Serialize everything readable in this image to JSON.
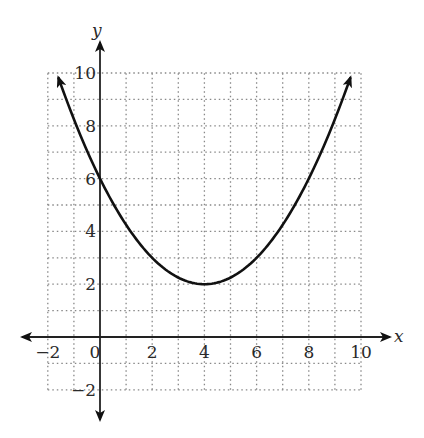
{
  "chart_data": {
    "type": "line",
    "title": "",
    "xlabel": "x",
    "ylabel": "y",
    "xlim": [
      -2,
      10
    ],
    "ylim": [
      -2,
      10
    ],
    "grid": true,
    "grid_step": 1,
    "x_ticks": [
      -2,
      0,
      2,
      4,
      6,
      8,
      10
    ],
    "y_ticks": [
      -2,
      2,
      4,
      6,
      8,
      10
    ],
    "x_tick_labels": [
      "−2",
      "0",
      "2",
      "4",
      "6",
      "8",
      "10"
    ],
    "y_tick_labels": [
      "−2",
      "2",
      "4",
      "6",
      "8",
      "10"
    ],
    "series": [
      {
        "name": "parabola",
        "equation": "y = 0.25(x - 4)^2 + 2",
        "vertex": [
          4,
          2
        ],
        "y_intercept": [
          0,
          6
        ],
        "x_range": [
          -1.6,
          9.6
        ],
        "points": [
          [
            -1.5,
            9.56
          ],
          [
            0,
            6
          ],
          [
            2,
            3
          ],
          [
            4,
            2
          ],
          [
            6,
            3
          ],
          [
            8,
            6
          ],
          [
            9.5,
            9.56
          ]
        ],
        "arrows_at_ends": true
      }
    ],
    "colors": {
      "curve": "#111111",
      "axis": "#222222",
      "grid": "#888888"
    }
  }
}
